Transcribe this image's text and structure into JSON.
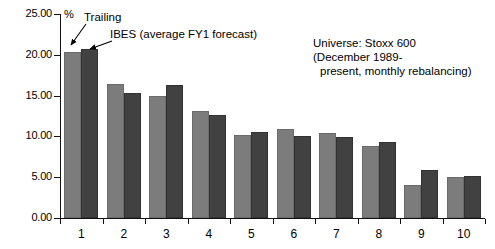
{
  "chart_data": {
    "type": "bar",
    "title": "",
    "subtitle": "",
    "xlabel": "",
    "ylabel": "%",
    "ylim": [
      0,
      25
    ],
    "ytick_values": [
      0,
      5,
      10,
      15,
      20,
      25
    ],
    "ytick_labels": [
      "0.00",
      "5.00",
      "10.00",
      "15.00",
      "20.00",
      "25.00"
    ],
    "grid": false,
    "legend_position": "annotated-arrows",
    "categories": [
      "1",
      "2",
      "3",
      "4",
      "5",
      "6",
      "7",
      "8",
      "9",
      "10"
    ],
    "series": [
      {
        "name": "Trailing",
        "color": "#7c7c7c",
        "values": [
          20.3,
          16.4,
          14.9,
          13.1,
          10.2,
          10.9,
          10.4,
          8.8,
          4.1,
          5.0
        ]
      },
      {
        "name": "IBES (average FY1 forecast)",
        "color": "#414141",
        "values": [
          20.7,
          15.3,
          16.3,
          12.6,
          10.5,
          10.0,
          9.9,
          9.3,
          5.9,
          5.1
        ]
      }
    ],
    "annotations": [
      {
        "id": "trailing-label",
        "text": "Trailing"
      },
      {
        "id": "ibes-label",
        "text": "IBES (average FY1 forecast)"
      }
    ],
    "universe_note": {
      "line1": "Universe: Stoxx 600",
      "line2": "(December 1989-",
      "line3": "present, monthly rebalancing)"
    }
  }
}
